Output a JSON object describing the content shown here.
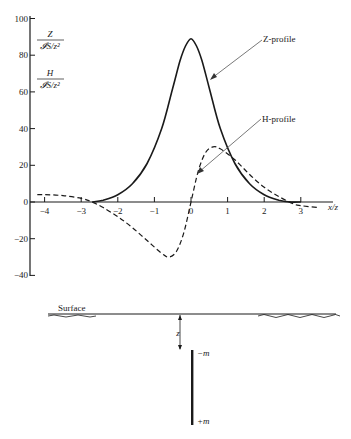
{
  "chart_data": {
    "type": "line",
    "title": "",
    "xlabel": "x/z",
    "ylabel_upper": {
      "numerator": "Z",
      "denominator": "𝓘S/z²"
    },
    "ylabel_lower": {
      "numerator": "H",
      "denominator": "𝓘S/z²"
    },
    "xlim": [
      -4.3,
      3.6
    ],
    "ylim": [
      -40,
      100
    ],
    "x_ticks": [
      -4,
      -3,
      -2,
      -1,
      0,
      1,
      2,
      3
    ],
    "x_tick_labels": [
      "−4",
      "−3",
      "−2",
      "−1",
      "0",
      "1",
      "2",
      "3"
    ],
    "y_ticks": [
      100,
      80,
      60,
      40,
      20,
      0,
      -20,
      -40
    ],
    "y_tick_labels": [
      "100",
      "80",
      "60",
      "40",
      "20",
      "0",
      "−20",
      "−40"
    ],
    "grid": false,
    "series": [
      {
        "name": "Z-profile",
        "style": "solid",
        "x": [
          -2.7,
          -2.4,
          -2.0,
          -1.6,
          -1.2,
          -0.8,
          -0.5,
          -0.3,
          -0.15,
          0,
          0.15,
          0.3,
          0.5,
          0.8,
          1.2,
          1.6,
          2.0,
          2.4,
          2.7,
          3.0
        ],
        "values": [
          0,
          1,
          4,
          10,
          21,
          40,
          62,
          77,
          85,
          89,
          85,
          77,
          62,
          40,
          21,
          10,
          4,
          1,
          0,
          0
        ]
      },
      {
        "name": "H-profile",
        "style": "dashed",
        "x": [
          -4.2,
          -4.0,
          -3.5,
          -3.0,
          -2.7,
          -2.4,
          -2.0,
          -1.6,
          -1.2,
          -0.8,
          -0.6,
          -0.4,
          -0.2,
          0,
          0.2,
          0.4,
          0.6,
          0.8,
          1.2,
          1.6,
          2.0,
          2.4,
          2.8,
          3.0,
          3.5
        ],
        "values": [
          4,
          4,
          3.5,
          2,
          0,
          -3,
          -8,
          -14,
          -21,
          -28,
          -30,
          -27,
          -17,
          0,
          17,
          27,
          30,
          29,
          23,
          15,
          8,
          3,
          -1,
          -2,
          -3
        ]
      }
    ],
    "annotations": [
      {
        "text": "Z-profile",
        "points_to": "Z-profile curve near x≈0.4, y≈56"
      },
      {
        "text": "H-profile",
        "points_to": "H-profile curve near x≈0.1, y≈14"
      }
    ]
  },
  "diagram": {
    "surface_label": "Surface",
    "depth_label": "z",
    "top_pole_label": "−m",
    "bottom_pole_label": "+m"
  }
}
